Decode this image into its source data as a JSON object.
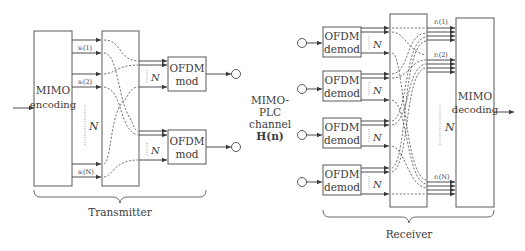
{
  "transmitter": {
    "label": "Transmitter",
    "mimo_encoding": {
      "line1": "MIMO",
      "line2": "encoding"
    },
    "signals": [
      "sₗ(1)",
      "sₗ(2)",
      "sₗ(N)"
    ],
    "signal_dots_label": "N",
    "ofdm_mod": [
      {
        "line1": "OFDM",
        "line2": "mod",
        "n_label": "N"
      },
      {
        "line1": "OFDM",
        "line2": "mod",
        "n_label": "N"
      }
    ]
  },
  "channel": {
    "line1": "MIMO-",
    "line2": "PLC",
    "line3": "channel",
    "line4": "H(n)"
  },
  "receiver": {
    "label": "Receiver",
    "ofdm_demod": [
      {
        "line1": "OFDM",
        "line2": "demod",
        "n_label": "N"
      },
      {
        "line1": "OFDM",
        "line2": "demod",
        "n_label": "N"
      },
      {
        "line1": "OFDM",
        "line2": "demod",
        "n_label": "N"
      },
      {
        "line1": "OFDM",
        "line2": "demod",
        "n_label": "N"
      }
    ],
    "signals": [
      "rₗ(1)",
      "rₗ(2)",
      "rₗ(N)"
    ],
    "signal_dots_label": "N",
    "mimo_decoding": {
      "line1": "MIMO",
      "line2": "decoding"
    }
  },
  "colors": {
    "stroke": "#5a5a5a",
    "text": "#3a3a3a",
    "background": "#ffffff"
  }
}
